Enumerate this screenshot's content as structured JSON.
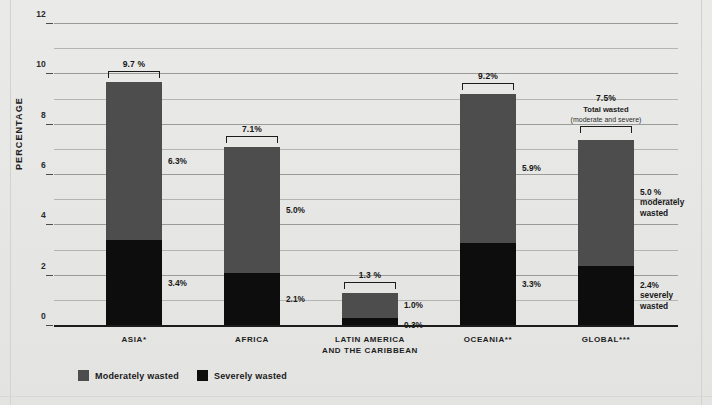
{
  "chart_data": {
    "type": "bar",
    "subtype": "stacked-bar",
    "title": "",
    "xlabel": "",
    "ylabel": "PERCENTAGE",
    "ylim": [
      0,
      12
    ],
    "y_ticks": [
      0,
      2,
      4,
      6,
      8,
      10,
      12
    ],
    "y_minor_step": 1,
    "grid": true,
    "legend_position": "bottom-left",
    "categories": [
      "ASIA*",
      "AFRICA",
      "LATIN AMERICA AND THE CARIBBEAN",
      "OCEANIA**",
      "GLOBAL***"
    ],
    "series": [
      {
        "name": "Moderately wasted",
        "color": "#4d4d4d",
        "values": [
          6.3,
          5.0,
          1.0,
          5.9,
          5.0
        ]
      },
      {
        "name": "Severely wasted",
        "color": "#0d0d0d",
        "values": [
          3.4,
          2.1,
          0.3,
          3.3,
          2.4
        ]
      }
    ],
    "totals": [
      9.7,
      7.1,
      1.3,
      9.2,
      7.5
    ]
  },
  "axis": {
    "y_title": "PERCENTAGE",
    "ticks": [
      {
        "value": 12,
        "label": "12"
      },
      {
        "value": 10,
        "label": "10"
      },
      {
        "value": 8,
        "label": "8"
      },
      {
        "value": 6,
        "label": "6"
      },
      {
        "value": 4,
        "label": "4"
      },
      {
        "value": 2,
        "label": "2"
      },
      {
        "value": 0,
        "label": "0"
      }
    ]
  },
  "bars": [
    {
      "key": "asia",
      "category_lines": [
        "ASIA*"
      ],
      "total_label": "9.7 %",
      "total_value": 9.7,
      "moderate_value": 6.3,
      "severe_value": 3.4,
      "moderate_label": "6.3%",
      "severe_label": "3.4%",
      "moderate_extra": [],
      "severe_extra": [],
      "total_sub": []
    },
    {
      "key": "africa",
      "category_lines": [
        "AFRICA"
      ],
      "total_label": "7.1%",
      "total_value": 7.1,
      "moderate_value": 5.0,
      "severe_value": 2.1,
      "moderate_label": "5.0%",
      "severe_label": "2.1%",
      "moderate_extra": [],
      "severe_extra": [],
      "total_sub": []
    },
    {
      "key": "latin-america",
      "category_lines": [
        "LATIN AMERICA",
        "AND THE CARIBBEAN"
      ],
      "total_label": "1.3 %",
      "total_value": 1.3,
      "moderate_value": 1.0,
      "severe_value": 0.3,
      "moderate_label": "1.0%",
      "severe_label": "0.3%",
      "moderate_extra": [],
      "severe_extra": [],
      "total_sub": []
    },
    {
      "key": "oceania",
      "category_lines": [
        "OCEANIA**"
      ],
      "total_label": "9.2%",
      "total_value": 9.2,
      "moderate_value": 5.9,
      "severe_value": 3.3,
      "moderate_label": "5.9%",
      "severe_label": "3.3%",
      "moderate_extra": [],
      "severe_extra": [],
      "total_sub": []
    },
    {
      "key": "global",
      "category_lines": [
        "GLOBAL***"
      ],
      "total_label": "7.5%",
      "total_value": 7.5,
      "moderate_value": 5.0,
      "severe_value": 2.4,
      "moderate_label": "5.0 %",
      "severe_label": "2.4%",
      "moderate_extra": [
        "moderately",
        "wasted"
      ],
      "severe_extra": [
        "severely",
        "wasted"
      ],
      "total_sub": [
        "Total wasted",
        "(moderate and severe)"
      ]
    }
  ],
  "legend": {
    "items": [
      {
        "label": "Moderately wasted",
        "color": "#4d4d4d"
      },
      {
        "label": "Severely wasted",
        "color": "#0d0d0d"
      }
    ]
  },
  "colors": {
    "background": "#e8e8e6",
    "moderate": "#4d4d4d",
    "severe": "#0d0d0d",
    "gridline": "#9a9a98",
    "axis": "#1c1c1c",
    "text": "#1a1a1a"
  }
}
